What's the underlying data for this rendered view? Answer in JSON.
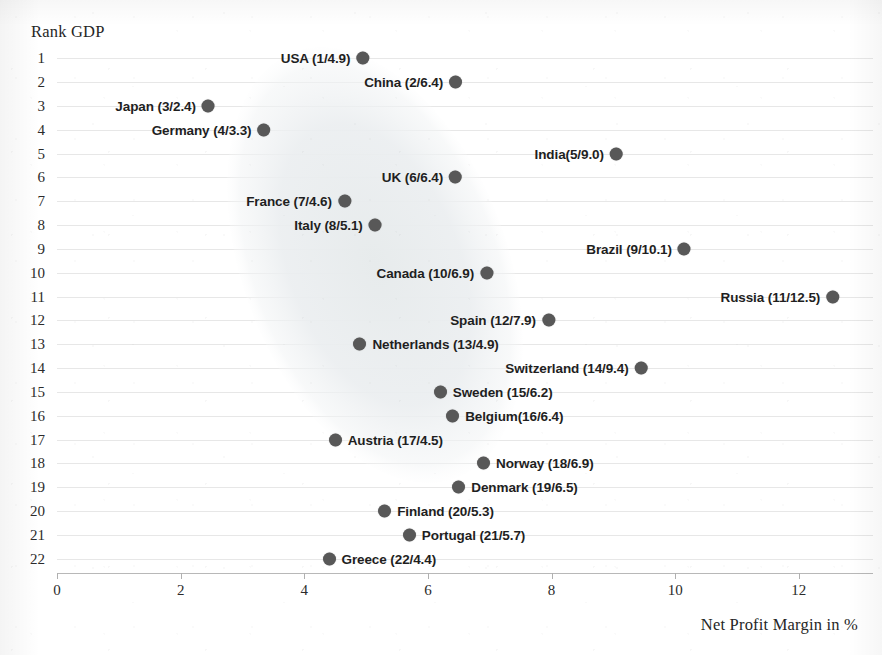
{
  "chart_data": {
    "type": "scatter",
    "title": "",
    "ylabel": "Rank GDP",
    "xlabel": "Net Profit Margin in %",
    "xlim": [
      0,
      13.2
    ],
    "ylim": [
      0.4,
      22.6
    ],
    "xticks": [
      "0",
      "2",
      "4",
      "6",
      "8",
      "10",
      "12"
    ],
    "xtick_values": [
      0,
      2,
      4,
      6,
      8,
      10,
      12
    ],
    "yticks": [
      "1",
      "2",
      "3",
      "4",
      "5",
      "6",
      "7",
      "8",
      "9",
      "10",
      "11",
      "12",
      "13",
      "14",
      "15",
      "16",
      "17",
      "18",
      "19",
      "20",
      "21",
      "22"
    ],
    "grid": "horizontal",
    "legend": "none",
    "point_color": "#585858",
    "highlight_region": {
      "shape": "ellipse",
      "color": "#eceff0",
      "note": "diagonal shaded cluster band from upper-left to lower-right"
    },
    "points": [
      {
        "label": "USA (1/4.9)",
        "country": "USA",
        "rank": 1,
        "margin": 4.9,
        "label_side": "left"
      },
      {
        "label": "China (2/6.4)",
        "country": "China",
        "rank": 2,
        "margin": 6.4,
        "label_side": "left"
      },
      {
        "label": "Japan (3/2.4)",
        "country": "Japan",
        "rank": 3,
        "margin": 2.4,
        "label_side": "left"
      },
      {
        "label": "Germany (4/3.3)",
        "country": "Germany",
        "rank": 4,
        "margin": 3.3,
        "label_side": "left"
      },
      {
        "label": "India(5/9.0)",
        "country": "India",
        "rank": 5,
        "margin": 9.0,
        "label_side": "left"
      },
      {
        "label": "UK (6/6.4)",
        "country": "UK",
        "rank": 6,
        "margin": 6.4,
        "label_side": "left"
      },
      {
        "label": "France (7/4.6)",
        "country": "France",
        "rank": 7,
        "margin": 4.6,
        "label_side": "left"
      },
      {
        "label": "Italy (8/5.1)",
        "country": "Italy",
        "rank": 8,
        "margin": 5.1,
        "label_side": "left"
      },
      {
        "label": "Brazil (9/10.1)",
        "country": "Brazil",
        "rank": 9,
        "margin": 10.1,
        "label_side": "left"
      },
      {
        "label": "Canada (10/6.9)",
        "country": "Canada",
        "rank": 10,
        "margin": 6.9,
        "label_side": "left"
      },
      {
        "label": "Russia (11/12.5)",
        "country": "Russia",
        "rank": 11,
        "margin": 12.5,
        "label_side": "left"
      },
      {
        "label": "Spain (12/7.9)",
        "country": "Spain",
        "rank": 12,
        "margin": 7.9,
        "label_side": "left"
      },
      {
        "label": "Netherlands (13/4.9)",
        "country": "Netherlands",
        "rank": 13,
        "margin": 4.9,
        "label_side": "right"
      },
      {
        "label": "Switzerland (14/9.4)",
        "country": "Switzerland",
        "rank": 14,
        "margin": 9.4,
        "label_side": "left"
      },
      {
        "label": "Sweden (15/6.2)",
        "country": "Sweden",
        "rank": 15,
        "margin": 6.2,
        "label_side": "right"
      },
      {
        "label": "Belgium(16/6.4)",
        "country": "Belgium",
        "rank": 16,
        "margin": 6.4,
        "label_side": "right"
      },
      {
        "label": "Austria (17/4.5)",
        "country": "Austria",
        "rank": 17,
        "margin": 4.5,
        "label_side": "right"
      },
      {
        "label": "Norway (18/6.9)",
        "country": "Norway",
        "rank": 18,
        "margin": 6.9,
        "label_side": "right"
      },
      {
        "label": "Denmark (19/6.5)",
        "country": "Denmark",
        "rank": 19,
        "margin": 6.5,
        "label_side": "right"
      },
      {
        "label": "Finland (20/5.3)",
        "country": "Finland",
        "rank": 20,
        "margin": 5.3,
        "label_side": "right"
      },
      {
        "label": "Portugal (21/5.7)",
        "country": "Portugal",
        "rank": 21,
        "margin": 5.7,
        "label_side": "right"
      },
      {
        "label": "Greece (22/4.4)",
        "country": "Greece",
        "rank": 22,
        "margin": 4.4,
        "label_side": "right"
      }
    ]
  }
}
